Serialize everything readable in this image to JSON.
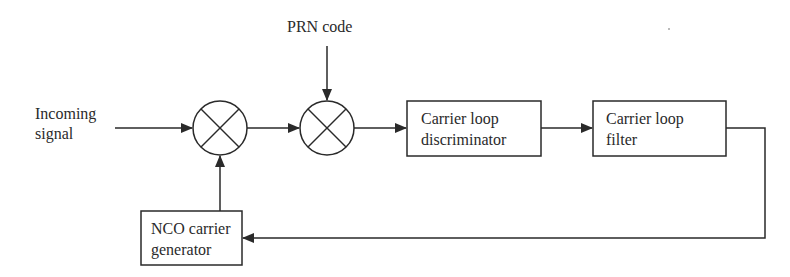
{
  "diagram": {
    "type": "block-diagram",
    "inputs": {
      "incoming_signal": {
        "line1": "Incoming",
        "line2": "signal"
      },
      "prn_code": "PRN code"
    },
    "blocks": [
      {
        "id": "mixer1",
        "kind": "multiplier"
      },
      {
        "id": "mixer2",
        "kind": "multiplier"
      },
      {
        "id": "discriminator",
        "line1": "Carrier loop",
        "line2": "discriminator"
      },
      {
        "id": "filter",
        "line1": "Carrier loop",
        "line2": "filter"
      },
      {
        "id": "nco",
        "line1": "NCO carrier",
        "line2": "generator"
      }
    ],
    "edges": [
      [
        "incoming_signal",
        "mixer1"
      ],
      [
        "mixer1",
        "mixer2"
      ],
      [
        "prn_code",
        "mixer2"
      ],
      [
        "mixer2",
        "discriminator"
      ],
      [
        "discriminator",
        "filter"
      ],
      [
        "filter",
        "nco"
      ],
      [
        "nco",
        "mixer1"
      ]
    ],
    "colors": {
      "stroke": "#2a2a2a",
      "background": "#ffffff"
    }
  }
}
